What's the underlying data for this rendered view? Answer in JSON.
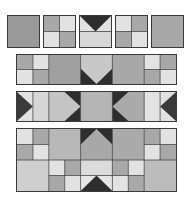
{
  "colors": {
    "dark": "#2e2e2e",
    "mid": "#9a9a9a",
    "midlight": "#b4b4b4",
    "light": "#e2e2e2",
    "border": "#3a3a3a"
  },
  "rows": [
    {
      "name": "individual-blocks",
      "blocks": [
        "solid-mid",
        "four-patch",
        "flying-geese-down",
        "four-patch-reversed",
        "solid-midlight"
      ]
    },
    {
      "name": "border-row-arrow-down",
      "blocks": [
        "four-patch",
        "solid-mid",
        "arrow-down",
        "solid-mid",
        "four-patch-reversed"
      ]
    },
    {
      "name": "chevron-row",
      "blocks": [
        "triangle-right",
        "strip-light",
        "chevron-right",
        "solid-center",
        "chevron-left",
        "strip-light",
        "triangle-left"
      ]
    },
    {
      "name": "two-tier-row",
      "blocks": [
        "four-patch",
        "solid-midlight",
        "arrow-up",
        "solid-midlight",
        "four-patch",
        "solid-light",
        "four-patch",
        "peak-up",
        "four-patch",
        "solid-light"
      ]
    }
  ]
}
